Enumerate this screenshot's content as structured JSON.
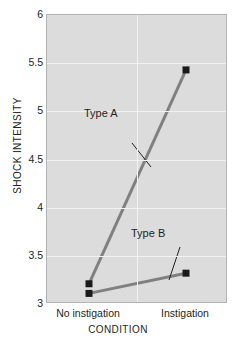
{
  "chart_data": {
    "type": "line",
    "title": "",
    "xlabel": "CONDITION",
    "ylabel": "SHOCK INTENSITY",
    "categories": [
      "No instigation",
      "Instigation"
    ],
    "ylim": [
      3,
      6
    ],
    "yticks": [
      "3",
      "3.5",
      "4",
      "4.5",
      "5",
      "5.5",
      "6"
    ],
    "ytick_values": [
      3,
      3.5,
      4,
      4.5,
      5,
      5.5,
      6
    ],
    "grid": true,
    "legend": "annotations",
    "series": [
      {
        "name": "Type A",
        "values": [
          3.21,
          5.43
        ],
        "color": "#808080",
        "marker": "square",
        "marker_color": "#1a1a1a"
      },
      {
        "name": "Type B",
        "values": [
          3.11,
          3.32
        ],
        "color": "#808080",
        "marker": "square",
        "marker_color": "#1a1a1a"
      }
    ],
    "annotations": [
      {
        "text": "Type A",
        "series": "Type A"
      },
      {
        "text": "Type B",
        "series": "Type B"
      }
    ]
  },
  "style": {
    "plot_background": "#dcdcdc",
    "gridline_color": "#f2f2f2",
    "axis_text_color": "#231f20",
    "line_color": "#808080",
    "marker_color": "#1a1a1a",
    "page_background": "#ffffff"
  }
}
